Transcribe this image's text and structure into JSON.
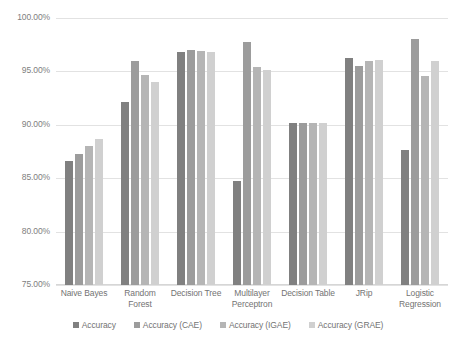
{
  "chart_data": {
    "type": "bar",
    "title": "",
    "subtitle": "",
    "xlabel": "",
    "ylabel": "",
    "ylim": [
      75,
      100
    ],
    "ytick_values": [
      75,
      80,
      85,
      90,
      95,
      100
    ],
    "ytick_labels": [
      "75.00%",
      "80.00%",
      "85.00%",
      "90.00%",
      "95.00%",
      "100.00%"
    ],
    "grid": true,
    "legend_position": "bottom-center",
    "value_format": "percent",
    "categories": [
      "Naive Bayes",
      "Random Forest",
      "Decision Tree",
      "Multilayer Perceptron",
      "Decision Table",
      "JRip",
      "Logistic Regression"
    ],
    "series": [
      {
        "name": "Accuracy",
        "color": "#808080",
        "values": [
          86.6,
          92.1,
          96.8,
          84.7,
          90.2,
          96.3,
          87.6
        ]
      },
      {
        "name": "Accuracy (CAE)",
        "color": "#9c9c9c",
        "values": [
          87.3,
          96.0,
          97.0,
          97.8,
          90.2,
          95.5,
          98.0
        ]
      },
      {
        "name": "Accuracy (IGAE)",
        "color": "#b5b5b5",
        "values": [
          88.0,
          94.7,
          96.9,
          95.4,
          90.2,
          96.0,
          94.6
        ]
      },
      {
        "name": "Accuracy (GRAE)",
        "color": "#d0d0d0",
        "values": [
          88.7,
          94.0,
          96.8,
          95.1,
          90.2,
          96.1,
          96.0
        ]
      }
    ]
  },
  "axis": {
    "gridline_color": "#e2e2e2",
    "tick_label_color": "#808080"
  }
}
